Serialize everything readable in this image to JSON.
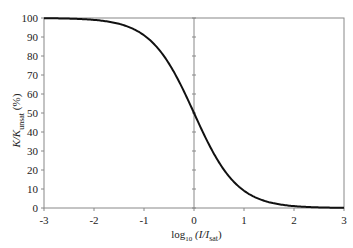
{
  "chart_data": {
    "type": "line",
    "title": "",
    "xlabel": "log10 (I/Isat)",
    "ylabel": "K/Kunsat (%)",
    "xlim": [
      -3,
      3
    ],
    "ylim": [
      0,
      100
    ],
    "x_ticks": [
      "-3",
      "-2",
      "-1",
      "0",
      "1",
      "2",
      "3"
    ],
    "y_ticks": [
      "0",
      "10",
      "20",
      "30",
      "40",
      "50",
      "60",
      "70",
      "80",
      "90",
      "100"
    ],
    "grid": false,
    "legend": null,
    "series": [
      {
        "name": "K/Kunsat",
        "x": [
          -3,
          -2.5,
          -2,
          -1.5,
          -1,
          -0.5,
          0,
          0.5,
          1,
          1.5,
          2,
          2.5,
          3
        ],
        "values": [
          99.9,
          99.7,
          99.0,
          96.9,
          90.9,
          76.0,
          50.0,
          24.0,
          9.1,
          3.1,
          1.0,
          0.3,
          0.1
        ]
      }
    ]
  },
  "labels": {
    "ylabel_main": "K/K",
    "ylabel_sub": "unsat",
    "ylabel_unit": "(%)",
    "xlabel_main": "log",
    "xlabel_sub": "10",
    "xlabel_open": " (I/I",
    "xlabel_sat": "sat",
    "xlabel_close": ")"
  }
}
